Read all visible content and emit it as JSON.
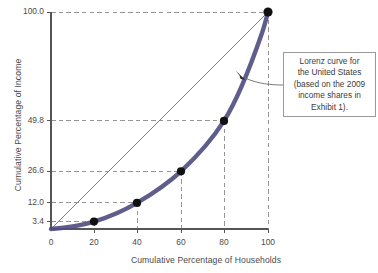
{
  "chart_data": {
    "type": "line",
    "title": "",
    "xlabel": "Cumulative Percentage of Households",
    "ylabel": "Cumulative Percentage of Income",
    "xlim": [
      0,
      100
    ],
    "ylim": [
      0,
      100
    ],
    "grid": "dashed-leader-lines-to-points",
    "legend": "none",
    "x_ticks": [
      "0",
      "20",
      "40",
      "60",
      "80",
      "100"
    ],
    "x_tick_values": [
      0,
      20,
      40,
      60,
      80,
      100
    ],
    "y_ticks": [
      "0",
      "3.4",
      "12.0",
      "26.6",
      "49.8",
      "100.0"
    ],
    "y_tick_values": [
      0,
      3.4,
      12.0,
      26.6,
      49.8,
      100.0
    ],
    "series": [
      {
        "name": "Lorenz curve for the United States",
        "color": "#504f82",
        "style": "thick-curve-with-markers",
        "x": [
          0,
          20,
          40,
          60,
          80,
          100
        ],
        "values": [
          0,
          3.4,
          12.0,
          26.6,
          49.8,
          100.0
        ]
      },
      {
        "name": "Line of equality",
        "color": "#707070",
        "style": "thin-straight-line",
        "x": [
          0,
          100
        ],
        "values": [
          0,
          100
        ]
      }
    ],
    "annotations": [
      {
        "name": "lorenz-curve-callout",
        "text": "Lorenz curve for the United States (based on the 2009 income shares in Exhibit 1).",
        "lines": [
          "Lorenz curve for",
          "the United States",
          "(based on the 2009",
          "income shares in",
          "Exhibit 1)."
        ],
        "points_to": "lorenz-curve"
      }
    ]
  },
  "colors": {
    "curve": "#504f82",
    "equality_line": "#6e6e6e",
    "axis": "#555555",
    "gridline": "#8a8a8a",
    "marker": "#111111",
    "annotation_border": "#9a9a9a",
    "background": "#ffffff"
  }
}
